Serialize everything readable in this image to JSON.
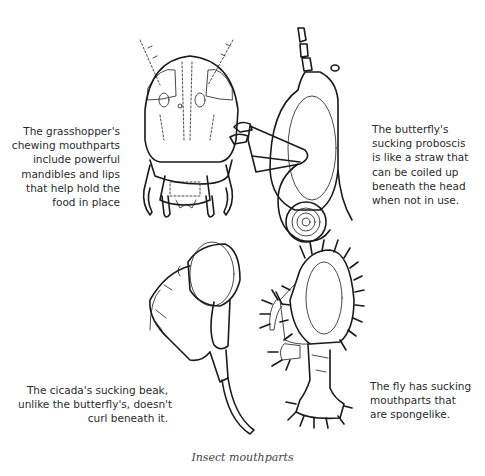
{
  "figure": {
    "title": "Insect mouthparts",
    "panels": [
      {
        "id": "grasshopper",
        "subject": "grasshopper-head-icon",
        "caption_lines": [
          "The grasshopper's",
          "chewing mouthparts",
          "include powerful",
          "mandibles and lips",
          "that help hold the",
          "food in place"
        ]
      },
      {
        "id": "butterfly",
        "subject": "butterfly-head-icon",
        "caption_lines": [
          "The butterfly's",
          "sucking proboscis",
          "is like a straw that",
          "can be coiled up",
          "beneath the head",
          "when not in use."
        ]
      },
      {
        "id": "cicada",
        "subject": "cicada-head-icon",
        "caption_lines": [
          "The cicada's sucking beak,",
          "unlike the butterfly's, doesn't",
          "curl beneath it."
        ]
      },
      {
        "id": "fly",
        "subject": "fly-head-icon",
        "caption_lines": [
          "The fly has sucking",
          "mouthparts that",
          "are spongelike."
        ]
      }
    ]
  }
}
